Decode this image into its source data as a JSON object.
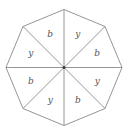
{
  "diagram": {
    "shape": "regular octagon divided into 8 triangles from center",
    "sectors_clockwise_from_top": [
      "y",
      "b",
      "y",
      "b",
      "y",
      "b",
      "y",
      "b"
    ],
    "colors": {
      "line": "#8a8a8a",
      "text": "#555555",
      "center_dot": "#222222"
    }
  }
}
